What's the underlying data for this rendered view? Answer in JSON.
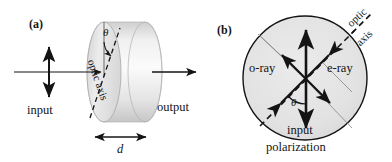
{
  "figure": {
    "type": "optics-diagram",
    "background_color": "#ffffff",
    "ink_color": "#141414",
    "crystal_fill_light": "#f2f2f2",
    "crystal_fill_mid": "#dedede",
    "crystal_fill_dark": "#c9c9c9",
    "guide_line_color": "#9a9a9a"
  },
  "panel_a": {
    "tag": "(a)",
    "input_label": "input",
    "output_label": "output",
    "optic_axis_label": "optic axis",
    "angle_symbol": "θ",
    "thickness_label": "d",
    "shape": "cylinder",
    "input_arrow": "vertical double-headed polarization arrow on horizontal beam",
    "output_arrow": "rightward single-headed beam arrow"
  },
  "panel_b": {
    "tag": "(b)",
    "optic_axis_label_line1": "optic",
    "optic_axis_label_line2": "axis",
    "o_ray_label": "o-ray",
    "e_ray_label": "e-ray",
    "angle_symbol": "θ",
    "input_label_line1": "input",
    "input_label_line2": "polarization",
    "shape": "circle cross-section",
    "vertical_arrow": "input polarization, vertical double-headed",
    "diagonal_arrows": "two double-headed arrows at ±45° for o-ray and e-ray components"
  }
}
